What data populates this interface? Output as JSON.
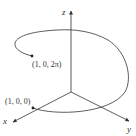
{
  "figure": {
    "axes": {
      "x_label": "x",
      "y_label": "y",
      "z_label": "z"
    },
    "points": [
      {
        "label": "(1, 0, 0)",
        "coords": [
          1,
          0,
          0
        ]
      },
      {
        "label": "(1, 0, 2π)",
        "coords": [
          1,
          0,
          "2π"
        ]
      }
    ],
    "colors": {
      "line": "#333333",
      "background": "#ffffff"
    }
  }
}
